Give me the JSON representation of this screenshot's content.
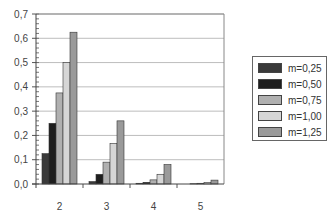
{
  "chart_data": {
    "type": "bar",
    "title": "",
    "xlabel": "",
    "ylabel": "",
    "categories": [
      "2",
      "3",
      "4",
      "5"
    ],
    "series": [
      {
        "name": "m=0,25",
        "color": "#3a3a3a",
        "values": [
          0.125,
          0.01,
          0.003,
          0.0
        ]
      },
      {
        "name": "m=0,50",
        "color": "#1e1e1e",
        "values": [
          0.25,
          0.04,
          0.007,
          0.001
        ]
      },
      {
        "name": "m=0,75",
        "color": "#b0b0b0",
        "values": [
          0.375,
          0.09,
          0.017,
          0.003
        ]
      },
      {
        "name": "m=1,00",
        "color": "#d6d6d6",
        "values": [
          0.5,
          0.167,
          0.04,
          0.007
        ]
      },
      {
        "name": "m=1,25",
        "color": "#9a9a9a",
        "values": [
          0.625,
          0.26,
          0.08,
          0.016
        ]
      }
    ],
    "ylim": [
      0,
      0.7
    ],
    "yticks": [
      "0,0",
      "0,1",
      "0,2",
      "0,3",
      "0,4",
      "0,5",
      "0,6",
      "0,7"
    ],
    "grid": true,
    "legend_position": "right"
  }
}
